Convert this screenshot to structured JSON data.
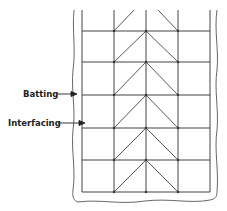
{
  "labels": {
    "batting": "Batting",
    "interfacing": "Interfacing"
  },
  "colors": {
    "line": "#444444",
    "text": "#222222",
    "background": "#ffffff"
  },
  "grid": {
    "columns_x": [
      82,
      114,
      146,
      178,
      210
    ],
    "rows_y": [
      31,
      62,
      95,
      128,
      160,
      192
    ],
    "top_y": 10
  }
}
